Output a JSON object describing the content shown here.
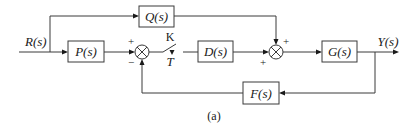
{
  "diagram": {
    "caption": "(a)",
    "signals": {
      "input": "R(s)",
      "output": "Y(s)"
    },
    "blocks": {
      "P": "P(s)",
      "Q": "Q(s)",
      "D": "D(s)",
      "G": "G(s)",
      "F": "F(s)"
    },
    "switch": {
      "label_top": "K",
      "label_bottom": "T"
    },
    "summing_junctions": {
      "sum1": {
        "sign_input": "+",
        "sign_feedback": "−"
      },
      "sum2": {
        "sign_top": "+",
        "sign_left": "+"
      }
    }
  }
}
